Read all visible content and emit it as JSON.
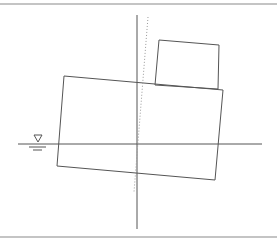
{
  "diagram": {
    "title": "",
    "colors": {
      "background": "#ffffff",
      "stroke": "#555555",
      "frame": "#8a8a8a",
      "dotted": "#9a9a9a"
    },
    "frame": {
      "top_y": 4,
      "bottom_y": 237
    },
    "waterline": {
      "x1": 18,
      "y": 144,
      "x2": 262
    },
    "water_symbol": {
      "triangle": [
        [
          34,
          135
        ],
        [
          42,
          135
        ],
        [
          38,
          142
        ]
      ],
      "underline_long": {
        "x1": 29,
        "x2": 46,
        "y": 147
      },
      "underline_short": {
        "x1": 33,
        "x2": 42,
        "y": 150
      }
    },
    "vertical_axis": {
      "x": 137,
      "y1": 15,
      "y2": 229
    },
    "tilted_axis": {
      "x1": 148,
      "y1": 17,
      "x2": 134,
      "y2": 192
    },
    "hull": [
      [
        64,
        76
      ],
      [
        223,
        90
      ],
      [
        215,
        180
      ],
      [
        57,
        166
      ]
    ],
    "deckhouse": [
      [
        159,
        40
      ],
      [
        219,
        45
      ],
      [
        218,
        89
      ],
      [
        155,
        85
      ]
    ]
  }
}
